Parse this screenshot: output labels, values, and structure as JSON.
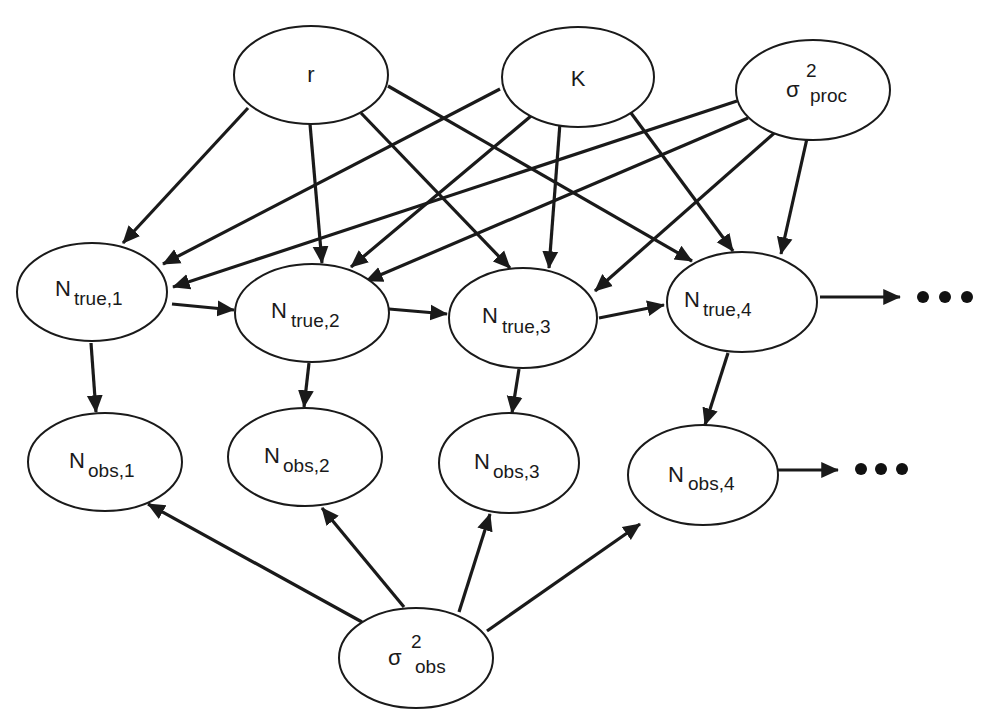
{
  "diagram": {
    "type": "directed-graph",
    "nodes": {
      "r": {
        "base": "r",
        "sub": "",
        "sup": ""
      },
      "K": {
        "base": "K",
        "sub": "",
        "sup": ""
      },
      "sigma_proc": {
        "base": "σ",
        "sub": "proc",
        "sup": "2"
      },
      "ntrue1": {
        "base": "N",
        "sub": "true,1",
        "sup": ""
      },
      "ntrue2": {
        "base": "N",
        "sub": "true,2",
        "sup": ""
      },
      "ntrue3": {
        "base": "N",
        "sub": "true,3",
        "sup": ""
      },
      "ntrue4": {
        "base": "N",
        "sub": "true,4",
        "sup": ""
      },
      "nobs1": {
        "base": "N",
        "sub": "obs,1",
        "sup": ""
      },
      "nobs2": {
        "base": "N",
        "sub": "obs,2",
        "sup": ""
      },
      "nobs3": {
        "base": "N",
        "sub": "obs,3",
        "sup": ""
      },
      "nobs4": {
        "base": "N",
        "sub": "obs,4",
        "sup": ""
      },
      "sigma_obs": {
        "base": "σ",
        "sub": "obs",
        "sup": "2"
      }
    },
    "edges": [
      [
        "r",
        "ntrue1"
      ],
      [
        "r",
        "ntrue2"
      ],
      [
        "r",
        "ntrue3"
      ],
      [
        "r",
        "ntrue4"
      ],
      [
        "K",
        "ntrue1"
      ],
      [
        "K",
        "ntrue2"
      ],
      [
        "K",
        "ntrue3"
      ],
      [
        "K",
        "ntrue4"
      ],
      [
        "sigma_proc",
        "ntrue1"
      ],
      [
        "sigma_proc",
        "ntrue2"
      ],
      [
        "sigma_proc",
        "ntrue3"
      ],
      [
        "sigma_proc",
        "ntrue4"
      ],
      [
        "ntrue1",
        "ntrue2"
      ],
      [
        "ntrue2",
        "ntrue3"
      ],
      [
        "ntrue3",
        "ntrue4"
      ],
      [
        "ntrue4",
        "continuation_true"
      ],
      [
        "ntrue1",
        "nobs1"
      ],
      [
        "ntrue2",
        "nobs2"
      ],
      [
        "ntrue3",
        "nobs3"
      ],
      [
        "ntrue4",
        "nobs4"
      ],
      [
        "nobs4",
        "continuation_obs"
      ],
      [
        "sigma_obs",
        "nobs1"
      ],
      [
        "sigma_obs",
        "nobs2"
      ],
      [
        "sigma_obs",
        "nobs3"
      ],
      [
        "sigma_obs",
        "nobs4"
      ]
    ],
    "continuation": "• • •"
  }
}
